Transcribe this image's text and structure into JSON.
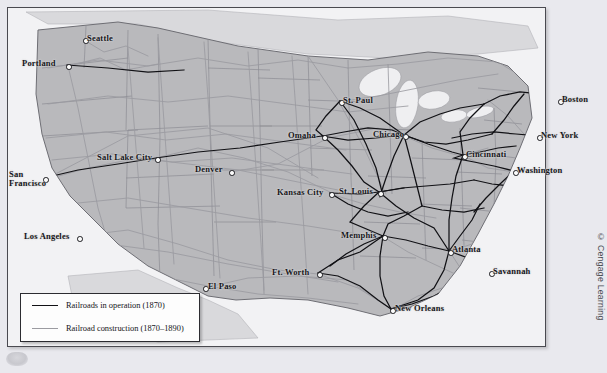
{
  "figure": {
    "kind": "historical-map",
    "credit": "© Cengage Learning"
  },
  "legend": {
    "items": [
      {
        "label": "Railroads in operation (1870)",
        "style": "solid-black",
        "color": "#111115"
      },
      {
        "label": "Railroad construction (1870–1890)",
        "style": "solid-gray",
        "color": "#9b9ba1"
      }
    ]
  },
  "cities": [
    {
      "name": "Seattle",
      "x": 76,
      "y": 31,
      "lx": 80,
      "ly": 27
    },
    {
      "name": "Portland",
      "x": 59,
      "y": 57,
      "lx": 19,
      "ly": 52
    },
    {
      "name": "San\nFrancisco",
      "x": 36,
      "y": 170,
      "lx": 9,
      "ly": 172
    },
    {
      "name": "Los Angeles",
      "x": 70,
      "y": 229,
      "lx": 22,
      "ly": 225
    },
    {
      "name": "Salt Lake City",
      "x": 148,
      "y": 150,
      "lx": 96,
      "ly": 147
    },
    {
      "name": "Denver",
      "x": 222,
      "y": 163,
      "lx": 193,
      "ly": 158
    },
    {
      "name": "El Paso",
      "x": 196,
      "y": 279,
      "lx": 200,
      "ly": 275
    },
    {
      "name": "Ft. Worth",
      "x": 310,
      "y": 265,
      "lx": 270,
      "ly": 261
    },
    {
      "name": "Omaha",
      "x": 315,
      "y": 128,
      "lx": 283,
      "ly": 124
    },
    {
      "name": "Kansas City",
      "x": 322,
      "y": 185,
      "lx": 277,
      "ly": 181
    },
    {
      "name": "St. Paul",
      "x": 332,
      "y": 93,
      "lx": 336,
      "ly": 88
    },
    {
      "name": "St. Louis",
      "x": 371,
      "y": 184,
      "lx": 336,
      "ly": 180
    },
    {
      "name": "Chicago",
      "x": 396,
      "y": 127,
      "lx": 372,
      "ly": 122
    },
    {
      "name": "Memphis",
      "x": 375,
      "y": 228,
      "lx": 340,
      "ly": 224
    },
    {
      "name": "New Orleans",
      "x": 383,
      "y": 301,
      "lx": 387,
      "ly": 297
    },
    {
      "name": "Atlanta",
      "x": 441,
      "y": 243,
      "lx": 444,
      "ly": 238
    },
    {
      "name": "Savannah",
      "x": 482,
      "y": 264,
      "lx": 485,
      "ly": 260
    },
    {
      "name": "Cincinnati",
      "x": 455,
      "y": 147,
      "lx": 458,
      "ly": 143
    },
    {
      "name": "Washington",
      "x": 506,
      "y": 163,
      "lx": 509,
      "ly": 159
    },
    {
      "name": "New York",
      "x": 530,
      "y": 128,
      "lx": 534,
      "ly": 124
    },
    {
      "name": "Boston",
      "x": 551,
      "y": 92,
      "lx": 555,
      "ly": 88
    }
  ],
  "colors": {
    "land": "#b9b9bc",
    "land_outer": "#d7d7da",
    "water": "#f2f2f4",
    "rail_operation": "#111115",
    "rail_construction": "#9b9ba1",
    "state_border": "#8a8a90",
    "frame": "#4a4a50",
    "page": "#e9e9ee"
  }
}
